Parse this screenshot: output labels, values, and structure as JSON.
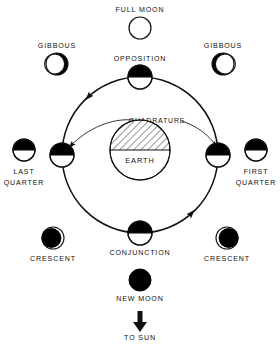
{
  "diagram": {
    "background_color": "#ffffff",
    "stroke_color": "#111111",
    "fill_dark_color": "#000000",
    "fill_light_color": "#ffffff"
  },
  "center_body": {
    "label": "EARTH",
    "hatch_half": "top",
    "cx": 140,
    "cy": 150,
    "r": 30
  },
  "orbit": {
    "cx": 140,
    "cy": 155,
    "r": 78,
    "direction": "counterclockwise",
    "arrow_count": 2
  },
  "quadrature": {
    "label": "QUADRATURE",
    "double_headed": true
  },
  "orbit_positions": [
    {
      "name": "opposition",
      "label": "OPPOSITION",
      "phase": "top-dark-half",
      "cx": 140,
      "cy": 77,
      "r": 12,
      "label_x": 140,
      "label_y": 59
    },
    {
      "name": "last-quarter-orbit",
      "label": "",
      "phase": "top-dark-half",
      "cx": 62,
      "cy": 155,
      "r": 12,
      "label_x": 0,
      "label_y": 0
    },
    {
      "name": "first-quarter-orbit",
      "label": "",
      "phase": "top-dark-half",
      "cx": 218,
      "cy": 155,
      "r": 12,
      "label_x": 0,
      "label_y": 0
    },
    {
      "name": "conjunction",
      "label": "CONJUNCTION",
      "phase": "top-dark-half",
      "cx": 140,
      "cy": 233,
      "r": 12,
      "label_x": 140,
      "label_y": 253
    }
  ],
  "outer_phases": [
    {
      "name": "full-moon",
      "label": "FULL MOON",
      "phase": "full-light",
      "cx": 140,
      "cy": 28,
      "r": 11,
      "label_x": 140,
      "label_y": 10
    },
    {
      "name": "gibbous-left",
      "label": "GIBBOUS",
      "phase": "gibbous-dark-right",
      "cx": 57,
      "cy": 64,
      "r": 11,
      "label_x": 57,
      "label_y": 46
    },
    {
      "name": "gibbous-right",
      "label": "GIBBOUS",
      "phase": "gibbous-dark-left",
      "cx": 223,
      "cy": 64,
      "r": 11,
      "label_x": 223,
      "label_y": 46
    },
    {
      "name": "last-quarter",
      "label_line1": "LAST",
      "label_line2": "QUARTER",
      "phase": "top-dark-half",
      "cx": 24,
      "cy": 150,
      "r": 11,
      "label_x": 24,
      "label_y": 172
    },
    {
      "name": "first-quarter",
      "label_line1": "FIRST",
      "label_line2": "QUARTER",
      "phase": "top-dark-half",
      "cx": 256,
      "cy": 150,
      "r": 11,
      "label_x": 256,
      "label_y": 172
    },
    {
      "name": "crescent-left",
      "label": "CRESCENT",
      "phase": "crescent-light-right",
      "cx": 53,
      "cy": 238,
      "r": 11,
      "label_x": 53,
      "label_y": 259
    },
    {
      "name": "crescent-right",
      "label": "CRESCENT",
      "phase": "crescent-light-left",
      "cx": 227,
      "cy": 238,
      "r": 11,
      "label_x": 227,
      "label_y": 259
    },
    {
      "name": "new-moon",
      "label": "NEW MOON",
      "phase": "full-dark",
      "cx": 140,
      "cy": 280,
      "r": 11,
      "label_x": 140,
      "label_y": 299
    }
  ],
  "sun_direction": {
    "label": "TO SUN",
    "arrow": "down-arrow",
    "label_x": 140,
    "label_y": 338
  }
}
